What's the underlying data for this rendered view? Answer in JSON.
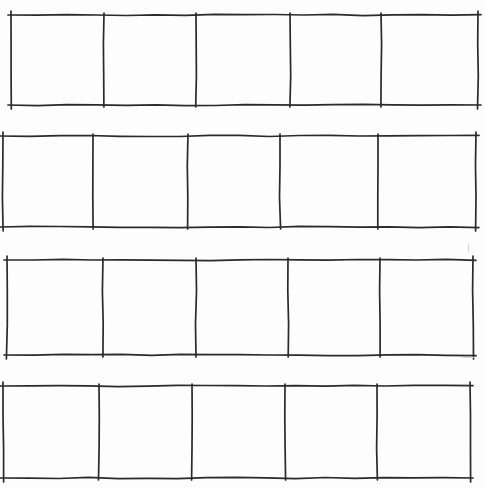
{
  "page": {
    "ink_color": "#2a2a2a",
    "paper_color": "#fdfdfd"
  },
  "strips": [
    {
      "id": "strip-1",
      "top": 15,
      "bottom": 105,
      "left": 11,
      "right": 478,
      "dividers": [
        104,
        196,
        290,
        381
      ],
      "cells": [
        "",
        "",
        "",
        "",
        ""
      ]
    },
    {
      "id": "strip-2",
      "top": 136,
      "bottom": 227,
      "left": 3,
      "right": 476,
      "dividers": [
        93,
        188,
        280,
        378
      ],
      "cells": [
        "",
        "",
        "",
        "",
        ""
      ]
    },
    {
      "id": "strip-3",
      "top": 260,
      "bottom": 355,
      "left": 7,
      "right": 473,
      "dividers": [
        103,
        196,
        288,
        380
      ],
      "cells": [
        "",
        "",
        "",
        "",
        ""
      ]
    },
    {
      "id": "strip-4",
      "top": 386,
      "bottom": 478,
      "left": 3,
      "right": 470,
      "dividers": [
        99,
        192,
        285,
        377
      ],
      "cells": [
        "",
        "",
        "",
        "",
        ""
      ]
    }
  ]
}
